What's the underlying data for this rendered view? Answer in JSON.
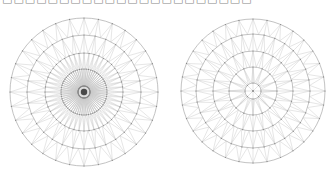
{
  "caption": {
    "text": "□□□□□□□□□□□□□□□□□□□□□□",
    "note": "clipped text at top edge, unreadable"
  },
  "colors": {
    "line": "#c8c8c8",
    "ring": "#a8a8a8",
    "dot": "#888888",
    "center": "#333333"
  },
  "meshes": [
    {
      "name": "left-mesh-dense",
      "cx": 84,
      "cy": 92,
      "rings": [
        74,
        57,
        39,
        23,
        6
      ],
      "divisions": [
        32,
        32,
        48,
        64,
        64
      ],
      "spokes": 64,
      "dense_center": true
    },
    {
      "name": "right-mesh-coarse",
      "cx": 253,
      "cy": 91,
      "rings": [
        72,
        57,
        40,
        24,
        8
      ],
      "divisions": [
        32,
        32,
        24,
        16,
        8
      ],
      "spokes": 8,
      "dense_center": false
    }
  ]
}
